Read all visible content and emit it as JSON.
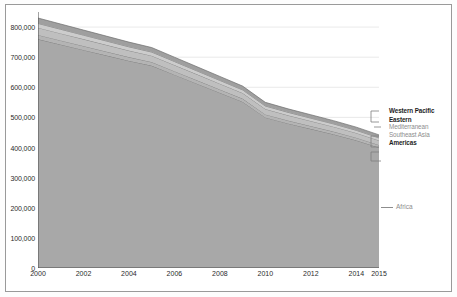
{
  "chart_data": {
    "type": "area",
    "stacked": true,
    "title": "",
    "subtitle": "",
    "xlabel": "",
    "ylabel": "",
    "x": [
      2000,
      2001,
      2002,
      2003,
      2004,
      2005,
      2006,
      2007,
      2008,
      2009,
      2010,
      2011,
      2012,
      2013,
      2014,
      2015
    ],
    "xlim": [
      2000,
      2015
    ],
    "ylim": [
      0,
      850000
    ],
    "yticks": [
      0,
      100000,
      200000,
      300000,
      400000,
      500000,
      600000,
      700000,
      800000
    ],
    "ytick_labels": [
      "0",
      "100,000",
      "200,000",
      "300,000",
      "400,000",
      "500,000",
      "600,000",
      "700,000",
      "800,000"
    ],
    "xticks": [
      2000,
      2002,
      2004,
      2006,
      2008,
      2010,
      2012,
      2014,
      2015
    ],
    "xtick_labels": [
      "2000",
      "2002",
      "2004",
      "2006",
      "2008",
      "2010",
      "2012",
      "2014",
      "2015"
    ],
    "grid": "horizontal",
    "legend_position": "right",
    "series": [
      {
        "name": "Africa",
        "color": "#a8a8a8",
        "values": [
          760000,
          742000,
          724000,
          706000,
          688000,
          672000,
          642000,
          612000,
          582000,
          552000,
          500000,
          480000,
          462000,
          444000,
          424000,
          400000
        ]
      },
      {
        "name": "Americas",
        "color": "#b4b4b4",
        "values": [
          14000,
          13600,
          13200,
          12800,
          12400,
          12000,
          11600,
          11200,
          10800,
          10400,
          10000,
          9700,
          9400,
          9100,
          8800,
          8500
        ]
      },
      {
        "name": "Southeast Asia",
        "color": "#bfbfbf",
        "values": [
          24000,
          23400,
          22800,
          22200,
          21600,
          21000,
          20400,
          19800,
          19200,
          18600,
          18000,
          17400,
          16800,
          16200,
          15600,
          15000
        ]
      },
      {
        "name": "Eastern Mediterranean",
        "color": "#cccccc",
        "values": [
          14000,
          13600,
          13200,
          12800,
          12400,
          12000,
          11600,
          11200,
          10800,
          10400,
          10000,
          9700,
          9400,
          9100,
          8800,
          8500
        ]
      },
      {
        "name": "Western Pacific",
        "color": "#9f9f9f",
        "values": [
          18000,
          17400,
          16800,
          16200,
          15600,
          15000,
          14400,
          13800,
          13200,
          12600,
          12000,
          11600,
          11200,
          10800,
          10400,
          10000
        ]
      }
    ]
  },
  "legend": {
    "entries": [
      {
        "label": "Western Pacific",
        "style": "dark"
      },
      {
        "label": "Eastern",
        "style": "dark"
      },
      {
        "label": "Mediterranean",
        "style": "mid"
      },
      {
        "label": "Southeast Asia",
        "style": "mid"
      },
      {
        "label": "Americas",
        "style": "dark"
      }
    ],
    "africa": "Africa"
  },
  "axes": {
    "y_ticks": [
      "800,000",
      "700,000",
      "600,000",
      "500,000",
      "400,000",
      "300,000",
      "200,000",
      "100,000",
      "0"
    ],
    "x_ticks": [
      "2000",
      "2002",
      "2004",
      "2006",
      "2008",
      "2010",
      "2012",
      "2014",
      "2015"
    ]
  },
  "colors": {
    "plot_fill_base": "#a8a8a8",
    "gridline": "#e3e3e3",
    "axis": "#4a4a4a",
    "frame": "#9a9a9a",
    "background": "#ffffff"
  }
}
